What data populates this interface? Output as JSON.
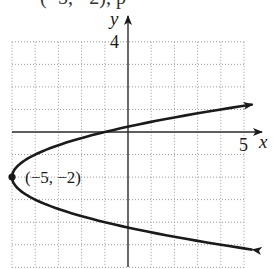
{
  "clipped_heading": "(−5, −2), p",
  "chart_data": {
    "type": "line",
    "title": "",
    "xlabel": "x",
    "ylabel": "y",
    "xlim": [
      -5,
      5
    ],
    "ylim": [
      -6,
      4
    ],
    "grid": true,
    "grid_style": "dotted",
    "tick_labels": {
      "x": [
        "5"
      ],
      "y": [
        "4"
      ]
    },
    "equation": "x = (y + 2)^2 - 5",
    "curve": "parabola opening right",
    "vertex": {
      "x": -5,
      "y": -2,
      "label": "(−5, −2)"
    },
    "series": [
      {
        "name": "parabola",
        "points": [
          {
            "x": 5.3,
            "y": -5.2
          },
          {
            "x": 4,
            "y": -5
          },
          {
            "x": 0,
            "y": -4.236
          },
          {
            "x": -1,
            "y": -4
          },
          {
            "x": -4,
            "y": -3
          },
          {
            "x": -5,
            "y": -2
          },
          {
            "x": -4,
            "y": -1
          },
          {
            "x": -1,
            "y": 0
          },
          {
            "x": 0,
            "y": 0.236
          },
          {
            "x": 4,
            "y": 1
          },
          {
            "x": 5.3,
            "y": 1.2
          }
        ],
        "arrows_at_ends": true
      }
    ],
    "colors": {
      "curve": "#1a1a1a",
      "axes": "#2a2a2a",
      "grid": "#9a9a9a"
    }
  },
  "labels": {
    "x_axis": "x",
    "y_axis": "y",
    "x_tick": "5",
    "y_tick": "4",
    "vertex": "(−5, −2)"
  }
}
